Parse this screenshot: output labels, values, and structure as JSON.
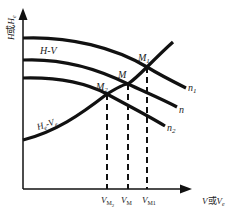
{
  "diagram": {
    "type": "pump-system operating point diagram",
    "axes": {
      "y_label_main": "H",
      "y_label_connector": "或",
      "y_label_alt": "H",
      "y_label_alt_sub": "e",
      "x_label_main": "V",
      "x_label_connector": "或",
      "x_label_alt": "V",
      "x_label_alt_sub": "e"
    },
    "curves": {
      "pump_curve_label": "H-V",
      "system_curve_label_H": "H",
      "system_curve_label_H_sub": "e",
      "system_curve_label_V": "-V",
      "system_curve_label_V_sub": "e",
      "speed_labels": [
        {
          "main": "n",
          "sub": "1"
        },
        {
          "main": "n",
          "sub": ""
        },
        {
          "main": "n",
          "sub": "2"
        }
      ]
    },
    "operating_points": [
      {
        "label": "M",
        "sub": "1"
      },
      {
        "label": "M",
        "sub": ""
      },
      {
        "label": "M",
        "sub": "2"
      }
    ],
    "x_ticks": [
      {
        "main": "V",
        "sub": "M",
        "subsub": "2"
      },
      {
        "main": "V",
        "sub": "M",
        "subsub": ""
      },
      {
        "main": "V",
        "sub": "M1",
        "subsub": ""
      }
    ],
    "colors": {
      "line": "#111111",
      "text": "#222222",
      "background": "#ffffff"
    }
  }
}
